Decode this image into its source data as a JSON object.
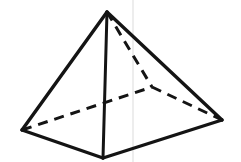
{
  "figure": {
    "name": "square-pyramid-wireframe",
    "canvas": {
      "width": 241,
      "height": 162,
      "background": "#ffffff"
    },
    "stroke_color": "#141414",
    "artifact_color": "#e9e9e9",
    "vertices": {
      "apex": {
        "label": "apex",
        "x": 107,
        "y": 12,
        "visible": true
      },
      "left": {
        "label": "base-left",
        "x": 22,
        "y": 130,
        "visible": true
      },
      "front": {
        "label": "base-front",
        "x": 103,
        "y": 158,
        "visible": true
      },
      "right": {
        "label": "base-right",
        "x": 222,
        "y": 120,
        "visible": true
      },
      "back": {
        "label": "base-back",
        "x": 152,
        "y": 87,
        "visible": false
      }
    },
    "edges": [
      {
        "name": "apex-to-left",
        "from": "apex",
        "to": "left",
        "style": "solid",
        "hidden": false
      },
      {
        "name": "apex-to-right",
        "from": "apex",
        "to": "right",
        "style": "solid",
        "hidden": false
      },
      {
        "name": "apex-to-front",
        "from": "apex",
        "to": "front",
        "style": "solid",
        "hidden": false
      },
      {
        "name": "left-to-front",
        "from": "left",
        "to": "front",
        "style": "solid",
        "hidden": false
      },
      {
        "name": "front-to-right",
        "from": "front",
        "to": "right",
        "style": "solid",
        "hidden": false
      },
      {
        "name": "apex-to-back",
        "from": "apex",
        "to": "back",
        "style": "dashed",
        "hidden": true
      },
      {
        "name": "left-to-back",
        "from": "left",
        "to": "back",
        "style": "dashed",
        "hidden": true
      },
      {
        "name": "back-to-right",
        "from": "back",
        "to": "right",
        "style": "dashed",
        "hidden": true
      }
    ],
    "artifacts": [
      {
        "name": "vertical-scan-line",
        "x": 133,
        "y1": 0,
        "y2": 162
      }
    ],
    "dash_pattern": "10 7",
    "solid_stroke_width": 3.4,
    "dashed_stroke_width": 3.0
  }
}
